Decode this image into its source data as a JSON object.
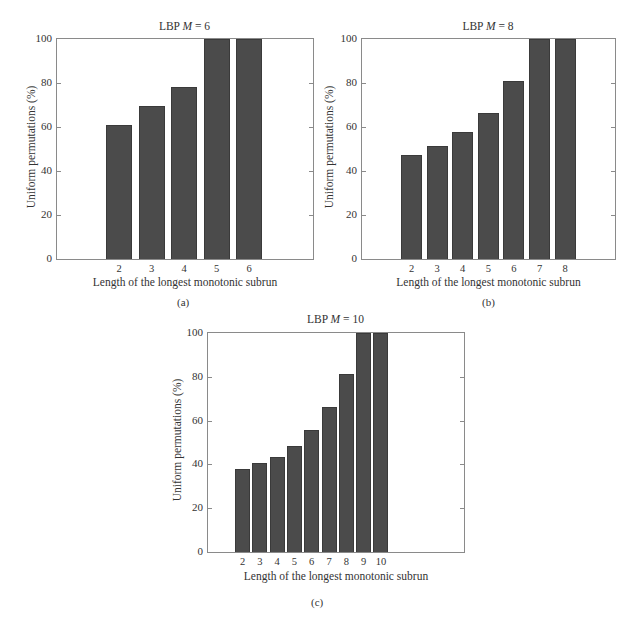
{
  "chart_data": [
    {
      "type": "bar",
      "panel": "(a)",
      "title_prefix": "LBP ",
      "title_var": "M",
      "title_suffix": " = 6",
      "xlabel": "Length of the longest monotonic subrun",
      "ylabel": "Uniform permutations (%)",
      "ylim": [
        0,
        100
      ],
      "yticks": [
        0,
        20,
        40,
        60,
        80,
        100
      ],
      "categories": [
        "2",
        "3",
        "4",
        "5",
        "6"
      ],
      "values": [
        61,
        69.5,
        78,
        100,
        100
      ],
      "grid": false,
      "bar_color": "#4b4b4b"
    },
    {
      "type": "bar",
      "panel": "(b)",
      "title_prefix": "LBP ",
      "title_var": "M",
      "title_suffix": " = 8",
      "xlabel": "Length of the longest monotonic subrun",
      "ylabel": "Uniform permutations (%)",
      "ylim": [
        0,
        100
      ],
      "yticks": [
        0,
        20,
        40,
        60,
        80,
        100
      ],
      "categories": [
        "2",
        "3",
        "4",
        "5",
        "6",
        "7",
        "8"
      ],
      "values": [
        47.3,
        51.4,
        57.7,
        66.4,
        81,
        100,
        100
      ],
      "grid": false,
      "bar_color": "#4b4b4b"
    },
    {
      "type": "bar",
      "panel": "(c)",
      "title_prefix": "LBP ",
      "title_var": "M",
      "title_suffix": " = 10",
      "xlabel": "Length of the longest monotonic subrun",
      "ylabel": "Uniform permutations (%)",
      "ylim": [
        0,
        100
      ],
      "yticks": [
        0,
        20,
        40,
        60,
        80,
        100
      ],
      "categories": [
        "2",
        "3",
        "4",
        "5",
        "6",
        "7",
        "8",
        "9",
        "10"
      ],
      "values": [
        37.7,
        40.5,
        43.6,
        48.2,
        55.5,
        66.4,
        81.2,
        100,
        100
      ],
      "grid": false,
      "bar_color": "#4b4b4b"
    }
  ]
}
